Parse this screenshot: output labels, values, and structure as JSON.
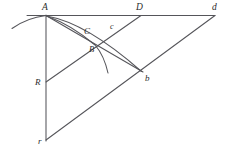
{
  "figure": {
    "width": 229,
    "height": 154,
    "background_color": "#ffffff",
    "stroke_color": "#55555a",
    "label_color": "#2b2b2b"
  },
  "labels": {
    "A": "A",
    "D": "D",
    "d": "d",
    "C": "C",
    "c": "c",
    "B": "B",
    "b": "b",
    "R": "R",
    "r": "r"
  },
  "points": {
    "A": {
      "x": 46,
      "y": 15
    },
    "D": {
      "x": 141,
      "y": 15
    },
    "d": {
      "x": 215,
      "y": 15
    },
    "C": {
      "x": 88,
      "y": 33
    },
    "c": {
      "x": 113,
      "y": 29
    },
    "B": {
      "x": 95,
      "y": 45
    },
    "b": {
      "x": 142,
      "y": 72
    },
    "R": {
      "x": 46,
      "y": 82
    },
    "r": {
      "x": 46,
      "y": 140
    }
  },
  "segments": [
    {
      "name": "horizontal-baseline-A-d",
      "from": "A",
      "to": "d"
    },
    {
      "name": "vertical-line-A-r",
      "from": "A",
      "to": "r"
    },
    {
      "name": "diagonal-line-r-d",
      "from": "r",
      "to": "d"
    },
    {
      "name": "line-R-D",
      "from": "R",
      "to": "D"
    },
    {
      "name": "line-A-b",
      "from": "A",
      "to": "b"
    }
  ],
  "arcs": [
    {
      "name": "arc-A-B",
      "from": "A",
      "to": "B"
    },
    {
      "name": "arc-A-b",
      "from": "A",
      "to": "b"
    },
    {
      "name": "arc-left-of-A",
      "from": "left-tail",
      "to": "A"
    },
    {
      "name": "arc-below-B",
      "from": "B",
      "to": "lower-tail"
    }
  ]
}
